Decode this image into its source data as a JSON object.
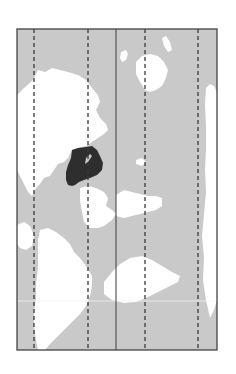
{
  "map": {
    "canvas": {
      "width": 236,
      "height": 374,
      "background": "#ffffff"
    },
    "frame": {
      "x": 17,
      "y": 29,
      "width": 200,
      "height": 321,
      "stroke": "#444444",
      "stroke_width": 1.3
    },
    "colors": {
      "ocean": "#c9c9c9",
      "land": "#ffffff",
      "highlight": "#2e2e2e",
      "grid_line": "#3a3a3a",
      "equator_line": "#f2f2f2"
    },
    "meridians": [
      {
        "x": 34,
        "style": "dashed"
      },
      {
        "x": 88,
        "style": "dashed"
      },
      {
        "x": 116,
        "style": "solid"
      },
      {
        "x": 145,
        "style": "dashed"
      },
      {
        "x": 198,
        "style": "dashed"
      }
    ],
    "parallels": [
      {
        "y": 301,
        "style": "faint"
      }
    ],
    "highlighted_region": {
      "label": "highlighted-country",
      "path": "M72,150 L78,148 L86,147 L92,146 L97,150 L100,156 L103,163 L102,170 L97,175 L90,178 L84,180 L79,182 L75,185 L72,186 L68,185 L66,180 L66,172 L68,165 L71,158 Z"
    },
    "landmasses": [
      {
        "name": "west-continent-upper",
        "path": "M17,95 L24,88 L33,80 L38,70 L45,72 L52,68 L60,70 L68,72 L78,75 L86,80 L92,88 L98,95 L100,102 L96,110 L100,118 L106,124 L108,130 L104,134 L98,138 L92,142 L86,146 L78,148 L72,150 L68,158 L64,162 L58,164 L54,170 L50,176 L44,178 L40,184 L36,188 L32,196 L28,192 L24,184 L20,176 L17,170 Z"
      },
      {
        "name": "west-continent-lower",
        "path": "M40,230 L48,228 L56,232 L64,238 L70,244 L74,252 L80,258 L86,266 L92,276 L92,286 L90,296 L86,306 L80,314 L74,320 L68,326 L62,332 L56,338 L50,344 L45,350 L38,350 L36,340 L34,326 L34,312 L36,298 L36,284 L38,268 L38,252 L38,240 Z"
      },
      {
        "name": "left-edge-island",
        "path": "M17,225 L24,222 L30,226 L34,236 L32,246 L26,250 L20,248 L17,244 Z"
      },
      {
        "name": "central-south-continent",
        "path": "M80,188 L88,186 L96,188 L104,192 L108,198 L106,206 L112,210 L116,214 L112,220 L104,226 L98,228 L90,228 L84,222 L82,212 L80,200 Z"
      },
      {
        "name": "mid-right-continent",
        "path": "M116,195 L124,190 L132,192 L140,194 L148,196 L156,196 L162,198 L162,206 L156,210 L148,212 L140,214 L132,216 L124,218 L116,216 Z"
      },
      {
        "name": "lower-right-continent",
        "path": "M104,282 L112,272 L120,264 L130,258 L142,256 L152,260 L162,266 L172,272 L180,276 L178,282 L170,286 L158,292 L146,298 L136,302 L124,303 L112,300 L104,294 Z"
      },
      {
        "name": "upper-right-continent",
        "path": "M136,62 L142,56 L150,54 L158,56 L164,62 L168,70 L166,78 L162,86 L156,90 L150,92 L145,90 L140,82 L136,74 Z"
      },
      {
        "name": "right-edge-continent",
        "path": "M206,88 L210,84 L214,86 L217,92 L217,300 L214,310 L210,318 L206,300 L203,280 L204,258 L202,236 L204,214 L206,192 L205,170 L206,148 L206,126 L205,104 Z"
      },
      {
        "name": "small-island-upper-middle",
        "path": "M121,52 L126,50 L128,54 L126,60 L122,62 L120,58 Z"
      },
      {
        "name": "small-island-upper-right",
        "path": "M162,38 L166,36 L170,42 L172,50 L168,52 L164,46 Z"
      },
      {
        "name": "small-island-center",
        "path": "M136,160 L142,158 L146,162 L142,166 L136,164 Z"
      }
    ]
  }
}
